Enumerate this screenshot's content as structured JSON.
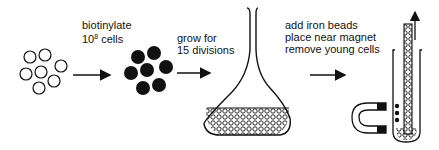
{
  "diagram": {
    "steps": [
      {
        "id": "start",
        "description": "open-cells",
        "label_lines": []
      },
      {
        "id": "biotinylate",
        "label_lines": [
          "biotinylate",
          "10",
          "8",
          " cells"
        ]
      },
      {
        "id": "grow",
        "label_lines": [
          "grow for",
          "15 divisions"
        ]
      },
      {
        "id": "separate",
        "label_lines": [
          "add iron beads",
          "place near magnet",
          "remove young cells"
        ]
      }
    ],
    "labels": {
      "biotinylate_line1": "biotinylate",
      "biotinylate_base": "10",
      "biotinylate_exp": "8",
      "biotinylate_rest": " cells",
      "grow_line1": "grow for",
      "grow_line2": "15 divisions",
      "separate_line1": "add iron beads",
      "separate_line2": "place near magnet",
      "separate_line3": "remove young cells"
    },
    "colors": {
      "ink": "#111111",
      "background": "#ffffff"
    }
  }
}
